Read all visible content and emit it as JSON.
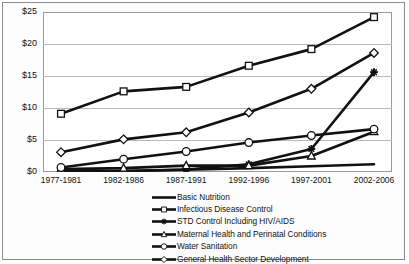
{
  "chart_data": {
    "type": "line",
    "title": "",
    "xlabel": "",
    "ylabel": "",
    "categories": [
      "1977-1981",
      "1982-1986",
      "1987-1991",
      "1992-1996",
      "1997-2001",
      "2002-2006"
    ],
    "ylim": [
      0,
      25
    ],
    "yticks": [
      0,
      5,
      10,
      15,
      20,
      25
    ],
    "ytick_labels": [
      "$0",
      "$5",
      "$10",
      "$15",
      "$20",
      "$25"
    ],
    "grid": "horizontal",
    "legend_position": "bottom",
    "series": [
      {
        "name": "Basic Nutrition",
        "marker": "none",
        "values": [
          0.1,
          0.15,
          0.35,
          0.6,
          0.9,
          1.2
        ]
      },
      {
        "name": "Infectious Disease Control",
        "marker": "open-square",
        "values": [
          9.1,
          12.6,
          13.3,
          16.6,
          19.2,
          24.2
        ]
      },
      {
        "name": "STD Control Including HIV/AIDS",
        "marker": "filled-plus",
        "values": [
          0.1,
          0.15,
          0.4,
          1.2,
          3.6,
          15.6
        ]
      },
      {
        "name": "Maternal Health and Perinatal Conditions",
        "marker": "open-triangle",
        "values": [
          0.45,
          0.6,
          1.0,
          1.0,
          2.5,
          6.3
        ]
      },
      {
        "name": "Water Sanitation",
        "marker": "open-circle",
        "values": [
          0.7,
          2.0,
          3.2,
          4.6,
          5.7,
          6.7
        ]
      },
      {
        "name": "General Health Sector Development",
        "marker": "open-diamond",
        "values": [
          3.1,
          5.1,
          6.2,
          9.3,
          13.0,
          18.6
        ]
      }
    ],
    "colors": {
      "line": "#111111",
      "marker_fill": "#ffffff",
      "grid": "#b9b9b9",
      "axis": "#9a9a9a",
      "text": "#121212",
      "background": "#ffffff",
      "frame": "#8a8a8a"
    }
  }
}
